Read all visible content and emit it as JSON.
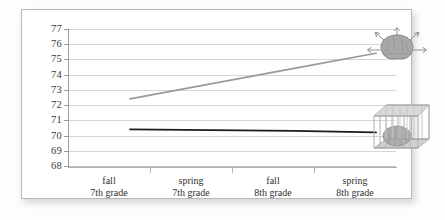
{
  "chart_data": {
    "type": "line",
    "title": "",
    "subtitle": "",
    "xlabel": "",
    "ylabel": "",
    "categories": [
      "fall 7th grade",
      "spring 7th grade",
      "fall 8th grade",
      "spring 8th grade"
    ],
    "category_lines": [
      [
        "fall",
        "7th grade"
      ],
      [
        "spring",
        "7th grade"
      ],
      [
        "fall",
        "8th grade"
      ],
      [
        "spring",
        "8th grade"
      ]
    ],
    "ylim": [
      68,
      77
    ],
    "yticks": [
      77,
      76,
      75,
      74,
      73,
      72,
      71,
      70,
      69,
      68
    ],
    "grid": "horizontal",
    "legend": "none",
    "series": [
      {
        "name": "growth-mindset-series",
        "color": "#9a9a9a",
        "values": [
          73,
          74,
          75,
          76
        ],
        "endpoint_icon": "brain-expanding-icon"
      },
      {
        "name": "fixed-mindset-series",
        "color": "#1c1c1c",
        "values": [
          71,
          70.95,
          70.9,
          70.8
        ],
        "endpoint_icon": "brain-caged-icon"
      }
    ],
    "annotations": [
      {
        "name": "brain-expanding-icon",
        "description": "gray brain with radiating arrows"
      },
      {
        "name": "brain-caged-icon",
        "description": "gray brain inside a wireframe cage"
      }
    ]
  },
  "colors": {
    "card_background": "#ffffff",
    "card_border": "#b9b9b9",
    "gridline": "#d6d6d6",
    "axis": "#9a9a9a",
    "tick_text": "#3a3a3a",
    "series_gray": "#9a9a9a",
    "series_black": "#1c1c1c"
  }
}
